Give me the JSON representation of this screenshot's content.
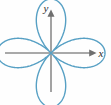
{
  "figure": {
    "background_color": "#fefefe",
    "width": 111,
    "height": 105
  },
  "axes": {
    "color": "#8c8c8c",
    "origin": {
      "x": 51,
      "y": 53
    },
    "x_axis": {
      "label": "x",
      "label_position": {
        "x": 101,
        "y": 57
      },
      "start": {
        "x": 5,
        "y": 53
      },
      "end": {
        "x": 93,
        "y": 53
      },
      "arrow": "right"
    },
    "y_axis": {
      "label": "y",
      "label_position": {
        "x": 47,
        "y": 11
      },
      "start": {
        "x": 51,
        "y": 92
      },
      "end": {
        "x": 51,
        "y": 13
      },
      "arrow": "up"
    }
  },
  "curve": {
    "name": "four-petaled-rose",
    "color": "#57a0c4",
    "line_width": 1.4,
    "equation": "r = a sin(2θ)",
    "petals": 4,
    "petal_orientation_degrees": [
      45,
      135,
      225,
      315
    ],
    "amplitude_pixels": 54
  },
  "chart_data": {
    "type": "line",
    "title": "",
    "xlabel": "x",
    "ylabel": "y",
    "grid": false,
    "legend": null,
    "xlim": [
      -1.2,
      1.2
    ],
    "ylim": [
      -1.2,
      1.2
    ],
    "series": [
      {
        "name": "r = a sin(2θ)",
        "color": "#57a0c4",
        "coordinate_system": "polar",
        "theta_degrees": [
          0,
          10,
          20,
          30,
          40,
          45,
          50,
          60,
          70,
          80,
          90,
          100,
          110,
          120,
          130,
          135,
          140,
          150,
          160,
          170,
          180,
          190,
          200,
          210,
          220,
          225,
          230,
          240,
          250,
          260,
          270,
          280,
          290,
          300,
          310,
          315,
          320,
          330,
          340,
          350,
          360
        ],
        "r_values": [
          0,
          0.342,
          0.643,
          0.866,
          0.985,
          1.0,
          0.985,
          0.866,
          0.643,
          0.342,
          0,
          -0.342,
          -0.643,
          -0.866,
          -0.985,
          -1.0,
          -0.985,
          -0.866,
          -0.643,
          -0.342,
          0,
          0.342,
          0.643,
          0.866,
          0.985,
          1.0,
          0.985,
          0.866,
          0.643,
          0.342,
          0,
          -0.342,
          -0.643,
          -0.866,
          -0.985,
          -1.0,
          -0.985,
          -0.866,
          -0.643,
          -0.342,
          0
        ]
      }
    ]
  }
}
